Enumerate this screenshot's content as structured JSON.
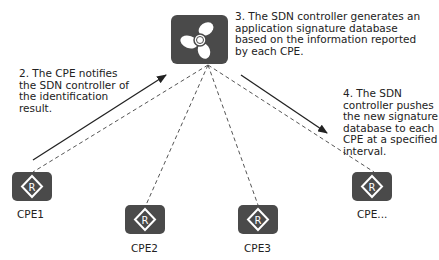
{
  "diagram": {
    "controller": {
      "name": "SDN controller",
      "icon": "fan-icon"
    },
    "steps": [
      {
        "id": "step2",
        "text": "2. The CPE notifies the SDN controller of the identification result.",
        "lines": [
          "2. The CPE notifies",
          "the SDN controller of",
          "the identification",
          "result."
        ]
      },
      {
        "id": "step3",
        "text": "3. The SDN controller generates an application signature database based on the information reported by each CPE.",
        "lines": [
          "3. The SDN controller generates an",
          "application signature database",
          "based on the information reported",
          "by each CPE."
        ]
      },
      {
        "id": "step4",
        "text": "4. The SDN controller pushes the new signature database to each CPE at a specified interval.",
        "lines": [
          "4. The SDN",
          "controller pushes",
          "the new signature",
          "database to each",
          "CPE at a specified",
          "interval."
        ]
      }
    ],
    "cpes": [
      {
        "label": "CPE1",
        "icon": "router-icon"
      },
      {
        "label": "CPE2",
        "icon": "router-icon"
      },
      {
        "label": "CPE3",
        "icon": "router-icon"
      },
      {
        "label": "CPE...",
        "icon": "router-icon"
      }
    ],
    "colors": {
      "node_fill": "#4a4a4a",
      "line": "#333333",
      "background": "#ffffff"
    }
  }
}
